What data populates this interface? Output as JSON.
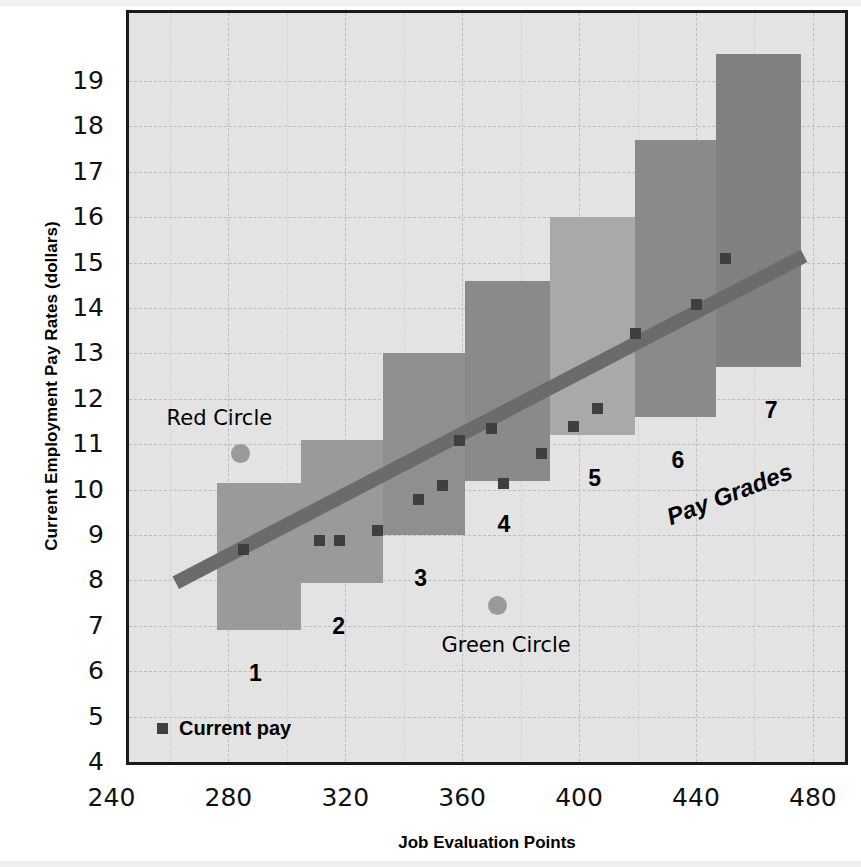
{
  "chart_data": {
    "type": "bar",
    "title": "",
    "xlabel": "Job Evaluation Points",
    "ylabel": "Current Employment Pay Rates (dollars)",
    "xlim": [
      246,
      491
    ],
    "ylim": [
      4,
      20.5
    ],
    "xticks": [
      240,
      280,
      320,
      360,
      400,
      440,
      480
    ],
    "yticks": [
      4,
      5,
      6,
      7,
      8,
      9,
      10,
      11,
      12,
      13,
      14,
      15,
      16,
      17,
      18,
      19
    ],
    "grid": true,
    "legend": [
      {
        "label": "Current pay",
        "marker": "square",
        "color": "#3f3f3f"
      }
    ],
    "legend_position": "bottom-left-inside",
    "series": [
      {
        "name": "Pay Grade Ranges",
        "type": "range-bar",
        "bars": [
          {
            "grade": "1",
            "x_start": 276,
            "x_end": 305,
            "y_min": 6.9,
            "y_max": 10.15,
            "color": "#9a9a9a",
            "label": "1"
          },
          {
            "grade": "2",
            "x_start": 305,
            "x_end": 333,
            "y_min": 7.95,
            "y_max": 11.1,
            "color": "#9a9a9a",
            "label": "2"
          },
          {
            "grade": "3",
            "x_start": 333,
            "x_end": 361,
            "y_min": 9.0,
            "y_max": 13.0,
            "color": "#8f8f8f",
            "label": "3"
          },
          {
            "grade": "4",
            "x_start": 361,
            "x_end": 390,
            "y_min": 10.2,
            "y_max": 14.6,
            "color": "#8a8a8a",
            "label": "4"
          },
          {
            "grade": "5",
            "x_start": 390,
            "x_end": 419,
            "y_min": 11.2,
            "y_max": 16.0,
            "color": "#a9a9a9",
            "label": "5"
          },
          {
            "grade": "6",
            "x_start": 419,
            "x_end": 447,
            "y_min": 11.6,
            "y_max": 17.7,
            "color": "#8a8a8a",
            "label": "6"
          },
          {
            "grade": "7",
            "x_start": 447,
            "x_end": 476,
            "y_min": 12.7,
            "y_max": 19.6,
            "color": "#808080",
            "label": "7"
          }
        ]
      },
      {
        "name": "Current pay",
        "type": "scatter",
        "marker": "square",
        "color": "#3f3f3f",
        "points": [
          {
            "x": 285,
            "y": 8.7
          },
          {
            "x": 311,
            "y": 8.9
          },
          {
            "x": 318,
            "y": 8.9
          },
          {
            "x": 331,
            "y": 9.1
          },
          {
            "x": 345,
            "y": 9.8
          },
          {
            "x": 353,
            "y": 10.1
          },
          {
            "x": 359,
            "y": 11.1
          },
          {
            "x": 370,
            "y": 11.35
          },
          {
            "x": 374,
            "y": 10.15
          },
          {
            "x": 387,
            "y": 10.8
          },
          {
            "x": 398,
            "y": 11.4
          },
          {
            "x": 406,
            "y": 11.8
          },
          {
            "x": 419,
            "y": 13.45
          },
          {
            "x": 440,
            "y": 14.1
          },
          {
            "x": 450,
            "y": 15.1
          }
        ]
      },
      {
        "name": "Market Line",
        "type": "line",
        "color": "#6b6b6b",
        "points": [
          {
            "x": 262,
            "y": 7.95
          },
          {
            "x": 477,
            "y": 15.15
          }
        ]
      },
      {
        "name": "Outliers",
        "type": "scatter",
        "marker": "circle",
        "points": [
          {
            "x": 284,
            "y": 10.8,
            "color": "#9a9a9a",
            "label": "Red Circle"
          },
          {
            "x": 372,
            "y": 7.45,
            "color": "#9a9a9a",
            "label": "Green Circle"
          }
        ]
      }
    ],
    "annotations": [
      {
        "text": "Red Circle",
        "x": 277,
        "y": 11.55,
        "anchor": "middle"
      },
      {
        "text": "Green Circle",
        "x": 375,
        "y": 6.55,
        "anchor": "middle"
      },
      {
        "text": "Pay Grades",
        "x": 432,
        "y": 9.7,
        "rotation": -21,
        "style": "bold-italic"
      }
    ]
  },
  "axes": {
    "y_title": "Current Employment Pay Rates (dollars)",
    "x_title": "Job Evaluation Points",
    "y_tick_labels": [
      "19",
      "18",
      "17",
      "16",
      "15",
      "14",
      "13",
      "12",
      "11",
      "10",
      "9",
      "8",
      "7",
      "6",
      "5",
      "4"
    ],
    "x_tick_labels": [
      "240",
      "280",
      "320",
      "360",
      "400",
      "440",
      "480"
    ]
  },
  "legend": {
    "current_pay_label": "Current pay"
  },
  "grade_labels": {
    "g1": "1",
    "g2": "2",
    "g3": "3",
    "g4": "4",
    "g5": "5",
    "g6": "6",
    "g7": "7"
  },
  "annotations": {
    "red_circle": "Red Circle",
    "green_circle": "Green Circle",
    "pay_grades": "Pay Grades"
  },
  "colors": {
    "plot_background": "#e3e3e3",
    "frame": "#1b1b1b",
    "gridline": "#bdbdbd",
    "bar_mid": "#9a9a9a",
    "bar_dark": "#8a8a8a",
    "bar_light": "#a9a9a9",
    "marker": "#3f3f3f",
    "trend_line": "#6b6b6b",
    "circle_marker": "#9a9a9a"
  }
}
